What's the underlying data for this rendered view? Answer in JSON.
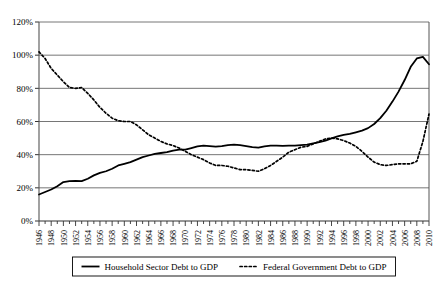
{
  "chart_data": {
    "type": "line",
    "title": "",
    "xlabel": "",
    "ylabel": "",
    "ylim": [
      0,
      120
    ],
    "xlim": [
      1946,
      2010
    ],
    "grid": true,
    "y_ticks": [
      "0%",
      "20%",
      "40%",
      "60%",
      "80%",
      "100%",
      "120%"
    ],
    "y_tick_values": [
      0,
      20,
      40,
      60,
      80,
      100,
      120
    ],
    "legend_position": "bottom",
    "x": [
      1946,
      1947,
      1948,
      1949,
      1950,
      1951,
      1952,
      1953,
      1954,
      1955,
      1956,
      1957,
      1958,
      1959,
      1960,
      1961,
      1962,
      1963,
      1964,
      1965,
      1966,
      1967,
      1968,
      1969,
      1970,
      1971,
      1972,
      1973,
      1974,
      1975,
      1976,
      1977,
      1978,
      1979,
      1980,
      1981,
      1982,
      1983,
      1984,
      1985,
      1986,
      1987,
      1988,
      1989,
      1990,
      1991,
      1992,
      1993,
      1994,
      1995,
      1996,
      1997,
      1998,
      1999,
      2000,
      2001,
      2002,
      2003,
      2004,
      2005,
      2006,
      2007,
      2008,
      2009,
      2010
    ],
    "x_tick_labels": [
      "1946",
      "1948",
      "1950",
      "1952",
      "1954",
      "1956",
      "1958",
      "1960",
      "1962",
      "1964",
      "1966",
      "1968",
      "1970",
      "1972",
      "1974",
      "1976",
      "1978",
      "1980",
      "1982",
      "1984",
      "1986",
      "1988",
      "1990",
      "1992",
      "1994",
      "1996",
      "1998",
      "2000",
      "2002",
      "2004",
      "2006",
      "2008",
      "2010"
    ],
    "series": [
      {
        "name": "Household Sector Debt to GDP",
        "style": "solid",
        "color": "#000000",
        "values": [
          16.0,
          17.5,
          19.0,
          21.0,
          23.5,
          24.0,
          24.2,
          24.0,
          25.5,
          27.5,
          29.0,
          30.0,
          31.5,
          33.5,
          34.5,
          35.5,
          37.0,
          38.5,
          39.5,
          40.5,
          41.0,
          41.5,
          42.5,
          43.0,
          43.0,
          44.0,
          45.0,
          45.5,
          45.2,
          44.8,
          45.2,
          45.8,
          46.0,
          45.8,
          45.2,
          44.5,
          44.2,
          45.0,
          45.5,
          45.5,
          45.3,
          45.5,
          45.5,
          45.8,
          46.0,
          46.8,
          47.5,
          48.5,
          49.8,
          51.0,
          52.0,
          52.5,
          53.5,
          54.5,
          56.0,
          58.5,
          62.0,
          66.5,
          72.0,
          78.0,
          85.0,
          93.0,
          98.0,
          99.0,
          94.5
        ]
      },
      {
        "name": "Federal Government Debt to GDP",
        "style": "dotted",
        "color": "#000000",
        "values": [
          102.0,
          98.0,
          92.0,
          88.0,
          84.0,
          80.5,
          80.0,
          80.5,
          77.0,
          73.0,
          68.5,
          65.0,
          62.0,
          60.5,
          60.0,
          60.0,
          58.0,
          55.0,
          52.0,
          50.0,
          48.0,
          46.5,
          45.5,
          44.0,
          42.0,
          40.0,
          38.5,
          37.0,
          35.0,
          33.5,
          33.5,
          33.0,
          32.0,
          31.0,
          31.0,
          30.5,
          30.0,
          31.5,
          33.5,
          36.0,
          38.5,
          41.5,
          43.0,
          44.5,
          45.0,
          46.5,
          48.0,
          49.5,
          50.0,
          49.5,
          48.5,
          47.0,
          45.0,
          42.0,
          38.5,
          35.5,
          34.0,
          33.5,
          34.0,
          34.5,
          34.5,
          34.5,
          36.0,
          48.0,
          64.5
        ]
      }
    ]
  },
  "legend": {
    "items": [
      {
        "label": "Household Sector Debt to GDP",
        "style": "solid"
      },
      {
        "label": "Federal Government Debt to GDP",
        "style": "dotted"
      }
    ]
  }
}
